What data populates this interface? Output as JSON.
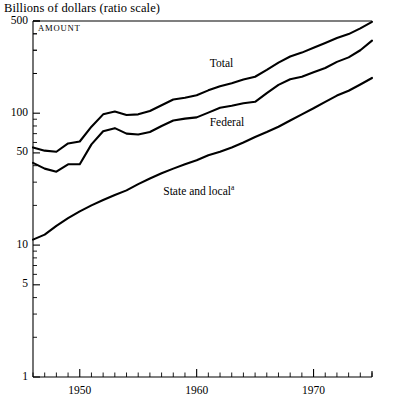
{
  "chart_data": {
    "type": "line",
    "title": "Billions of dollars (ratio scale)",
    "panel_label": "AMOUNT",
    "xlabel": "",
    "ylabel": "Billions of dollars",
    "scale": "log",
    "ylim": [
      1,
      500
    ],
    "xlim": [
      1946,
      1975
    ],
    "grid": false,
    "legend_position": "inline-annotations",
    "ytick_labels": [
      "500",
      "100",
      "50",
      "10",
      "5",
      "1"
    ],
    "ytick_values": [
      500,
      100,
      50,
      10,
      5,
      1
    ],
    "xtick_labels": [
      "1950",
      "1960",
      "1970"
    ],
    "xtick_values": [
      1950,
      1960,
      1970
    ],
    "footnote_marker": "a",
    "x": [
      1946,
      1947,
      1948,
      1949,
      1950,
      1951,
      1952,
      1953,
      1954,
      1955,
      1956,
      1957,
      1958,
      1959,
      1960,
      1961,
      1962,
      1963,
      1964,
      1965,
      1966,
      1967,
      1968,
      1969,
      1970,
      1971,
      1972,
      1973,
      1974,
      1975
    ],
    "series": [
      {
        "name": "Total",
        "label": "Total",
        "label_x": 1963,
        "values": [
          55,
          52,
          51,
          59,
          61,
          79,
          98,
          103,
          97,
          98,
          104,
          115,
          127,
          131,
          137,
          149,
          160,
          169,
          180,
          189,
          213,
          242,
          269,
          288,
          313,
          340,
          371,
          398,
          440,
          493
        ]
      },
      {
        "name": "Federal",
        "label": "Federal",
        "label_x": 1963,
        "values": [
          42,
          38,
          36,
          41,
          41,
          58,
          73,
          77,
          70,
          69,
          72,
          80,
          88,
          91,
          93,
          101,
          110,
          114,
          119,
          122,
          142,
          164,
          181,
          189,
          204,
          220,
          245,
          265,
          300,
          355
        ]
      },
      {
        "name": "State and local",
        "label": "State and local",
        "label_x": 1958,
        "values": [
          11,
          12,
          14,
          16,
          18,
          20,
          22,
          24,
          26,
          29,
          32,
          35,
          38,
          41,
          44,
          48,
          51,
          55,
          60,
          66,
          72,
          79,
          88,
          98,
          109,
          122,
          136,
          148,
          165,
          185
        ]
      }
    ]
  }
}
